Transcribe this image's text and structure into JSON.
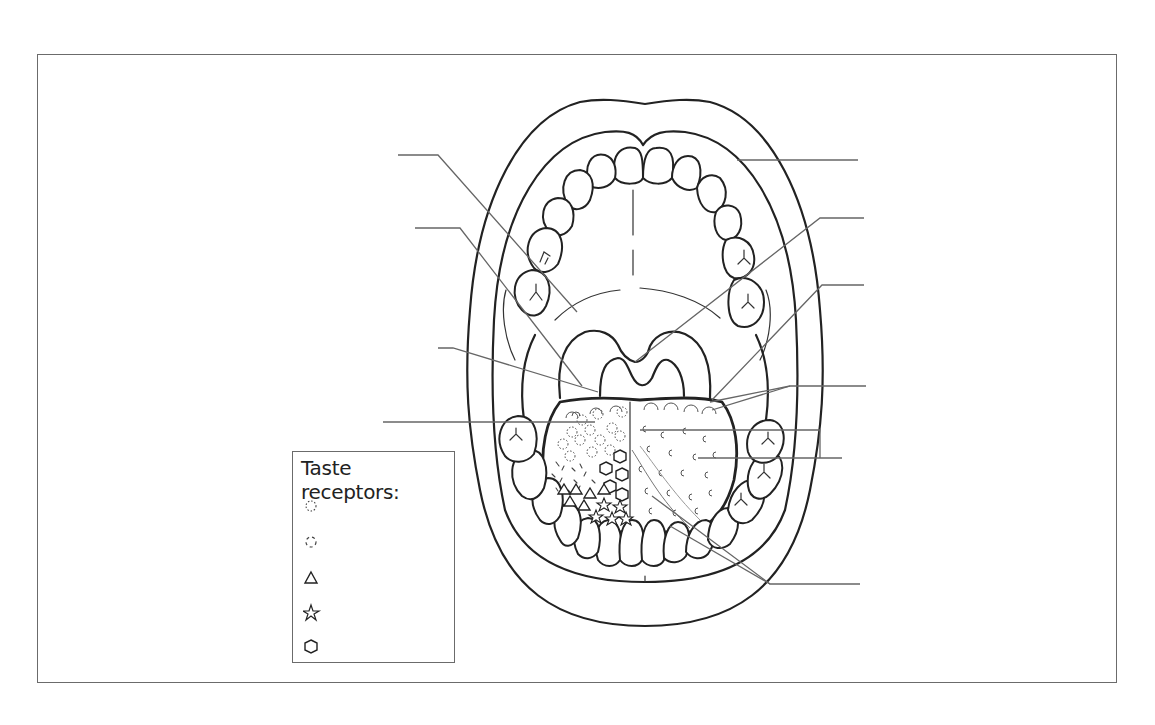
{
  "diagram": {
    "style": "black line-art worksheet, unlabeled leader lines",
    "frame_color": "#6b6b6b",
    "line_color": "#222222",
    "background": "#ffffff"
  },
  "legend": {
    "title": "Taste receptors:",
    "items": [
      {
        "icon": "dotted-circle-icon",
        "label": ""
      },
      {
        "icon": "dashed-circle-icon",
        "label": ""
      },
      {
        "icon": "triangle-icon",
        "label": ""
      },
      {
        "icon": "star-icon",
        "label": ""
      },
      {
        "icon": "hexagon-icon",
        "label": ""
      }
    ]
  },
  "leader_lines": {
    "left": [
      {
        "id": "L1",
        "label": "",
        "target": "palate"
      },
      {
        "id": "L2",
        "label": "",
        "target": "palatoglossal arch"
      },
      {
        "id": "L3",
        "label": "",
        "target": "palatine tonsil"
      },
      {
        "id": "L4",
        "label": "",
        "target": "tongue back"
      }
    ],
    "right": [
      {
        "id": "R1",
        "label": "",
        "target": "lip"
      },
      {
        "id": "R2",
        "label": "",
        "target": "uvula"
      },
      {
        "id": "R3",
        "label": "",
        "target": "palatopharyngeal arch"
      },
      {
        "id": "R4",
        "label": "",
        "target": "circumvallate papillae"
      },
      {
        "id": "R5",
        "label": "",
        "target": "fungiform papillae"
      },
      {
        "id": "R6",
        "label": "",
        "target": "filiform papillae"
      }
    ]
  }
}
